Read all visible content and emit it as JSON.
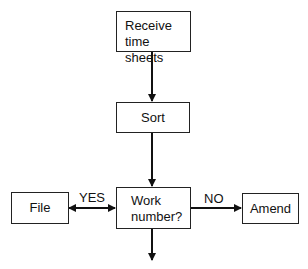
{
  "diagram": {
    "type": "flowchart",
    "nodes": [
      {
        "id": "receive",
        "label": "Receive time sheets"
      },
      {
        "id": "sort",
        "label": "Sort"
      },
      {
        "id": "decision",
        "label": "Work number?"
      },
      {
        "id": "file",
        "label": "File"
      },
      {
        "id": "amend",
        "label": "Amend"
      }
    ],
    "edges": [
      {
        "from": "receive",
        "to": "sort"
      },
      {
        "from": "sort",
        "to": "decision"
      },
      {
        "from": "decision",
        "to": "file",
        "label": "YES",
        "bidirectional": true
      },
      {
        "from": "decision",
        "to": "amend",
        "label": "NO"
      },
      {
        "from": "decision",
        "to": "next"
      }
    ],
    "labels": {
      "yes": "YES",
      "no": "NO"
    },
    "receive_line1": "Receive",
    "receive_line2": "time sheets",
    "sort": "Sort",
    "decision_line1": "Work",
    "decision_line2": "number?",
    "file": "File",
    "amend": "Amend"
  }
}
